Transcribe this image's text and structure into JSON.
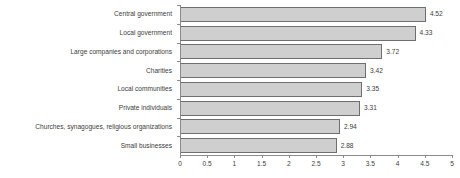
{
  "chart_data": {
    "type": "bar",
    "orientation": "horizontal",
    "title": "",
    "xlabel": "",
    "ylabel": "",
    "xlim": [
      0,
      5
    ],
    "xticks": [
      "0",
      "0.5",
      "1",
      "1.5",
      "2",
      "2.5",
      "3",
      "3.5",
      "4",
      "4.5",
      "5"
    ],
    "grid": false,
    "legend": false,
    "categories": [
      "Central government",
      "Local government",
      "Large companies and corporations",
      "Charities",
      "Local communities",
      "Private individuals",
      "Churches, synagogues, religious organizations",
      "Small businesses"
    ],
    "values": [
      4.52,
      4.33,
      3.72,
      3.42,
      3.35,
      3.31,
      2.94,
      2.88
    ],
    "value_labels": [
      "4.52",
      "4.33",
      "3.72",
      "3.42",
      "3.35",
      "3.31",
      "2.94",
      "2.88"
    ],
    "colors": {
      "bar_fill": "#cfcfcf",
      "bar_border": "#6e6e6e",
      "axis": "#8a8a8a",
      "text": "#3d3d3d",
      "background": "#ffffff"
    }
  }
}
